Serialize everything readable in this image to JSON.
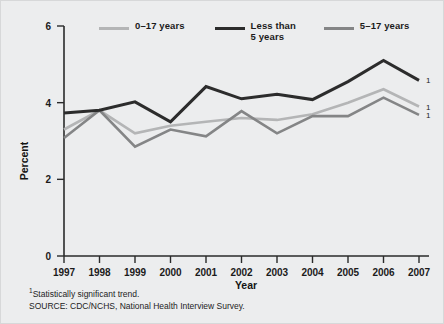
{
  "chart_data": {
    "type": "line",
    "title": "",
    "subtitle": "",
    "xlabel": "Year",
    "ylabel": "Percent",
    "x": [
      1997,
      1998,
      1999,
      2000,
      2001,
      2002,
      2003,
      2004,
      2005,
      2006,
      2007
    ],
    "categories": [
      "1997",
      "1998",
      "1999",
      "2000",
      "2001",
      "2002",
      "2003",
      "2004",
      "2005",
      "2006",
      "2007"
    ],
    "xlim": [
      1997,
      2007
    ],
    "ylim": [
      0,
      6
    ],
    "yticks": [
      0,
      2,
      4,
      6
    ],
    "yticklabels": [
      "0",
      "2",
      "4",
      "6"
    ],
    "grid": false,
    "legend_position": "top",
    "series": [
      {
        "name": "0–17 years",
        "color": "#b4b5b6",
        "linewidth": 2.6,
        "values": [
          3.3,
          3.8,
          3.2,
          3.4,
          3.5,
          3.6,
          3.55,
          3.7,
          4.0,
          4.35,
          3.9
        ],
        "endpoint_note": "1"
      },
      {
        "name": "Less than\n5 years",
        "color": "#2c2c2c",
        "linewidth": 3.0,
        "values": [
          3.73,
          3.8,
          4.02,
          3.5,
          4.42,
          4.1,
          4.22,
          4.08,
          4.55,
          5.1,
          4.58
        ],
        "endpoint_note": "1"
      },
      {
        "name": "5–17 years",
        "color": "#848586",
        "linewidth": 2.6,
        "values": [
          3.08,
          3.8,
          2.85,
          3.3,
          3.12,
          3.78,
          3.2,
          3.65,
          3.65,
          4.13,
          3.68
        ],
        "endpoint_note": "1"
      }
    ],
    "annotations": [
      {
        "text": "1",
        "series": "0–17 years",
        "x": 2007
      },
      {
        "text": "1",
        "series": "Less than 5 years",
        "x": 2007
      },
      {
        "text": "1",
        "series": "5–17 years",
        "x": 2007
      }
    ]
  },
  "legend": {
    "items": [
      {
        "label": "0–17 years",
        "color": "#b4b5b6"
      },
      {
        "label": "Less than\n5 years",
        "color": "#2c2c2c"
      },
      {
        "label": "5–17 years",
        "color": "#848586"
      }
    ]
  },
  "axes": {
    "y_title": "Percent",
    "x_title": "Year",
    "y_ticks": [
      "0",
      "2",
      "4",
      "6"
    ],
    "x_ticks": [
      "1997",
      "1998",
      "1999",
      "2000",
      "2001",
      "2002",
      "2003",
      "2004",
      "2005",
      "2006",
      "2007"
    ]
  },
  "footnotes": {
    "marker": "1",
    "line1": "Statistically significant trend.",
    "line2": "SOURCE: CDC/NCHS, National Health Interview Survey."
  }
}
